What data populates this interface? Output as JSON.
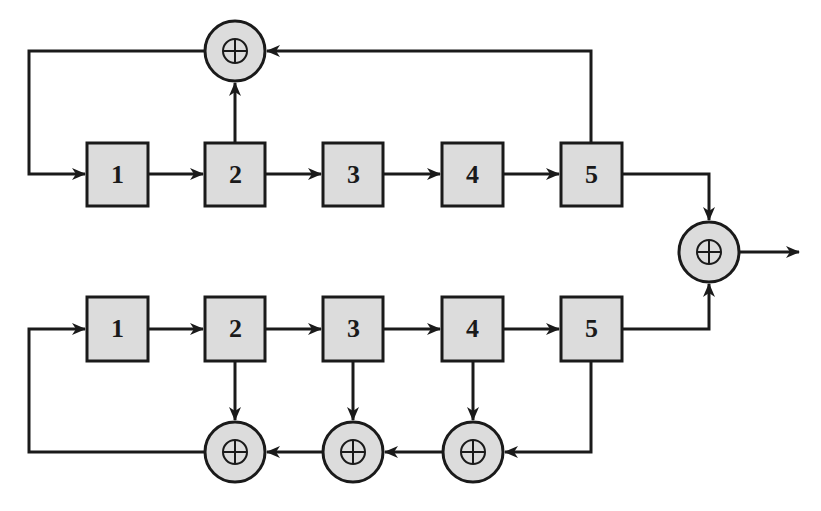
{
  "diagram": {
    "type": "dual LFSR combined by XOR (Gold code generator)",
    "colors": {
      "stroke": "#1a1a1a",
      "fill": "#dcdcdc",
      "background": "#ffffff"
    },
    "top_register": {
      "stages": [
        {
          "label": "1"
        },
        {
          "label": "2"
        },
        {
          "label": "3"
        },
        {
          "label": "4"
        },
        {
          "label": "5"
        }
      ],
      "feedback_taps": [
        "2",
        "5"
      ],
      "xor_count": 1
    },
    "bottom_register": {
      "stages": [
        {
          "label": "1"
        },
        {
          "label": "2"
        },
        {
          "label": "3"
        },
        {
          "label": "4"
        },
        {
          "label": "5"
        }
      ],
      "feedback_taps": [
        "2",
        "3",
        "4",
        "5"
      ],
      "xor_count": 3
    },
    "output_xor": {
      "inputs": [
        "top stage 5",
        "bottom stage 5"
      ],
      "symbol": "⊕"
    }
  }
}
